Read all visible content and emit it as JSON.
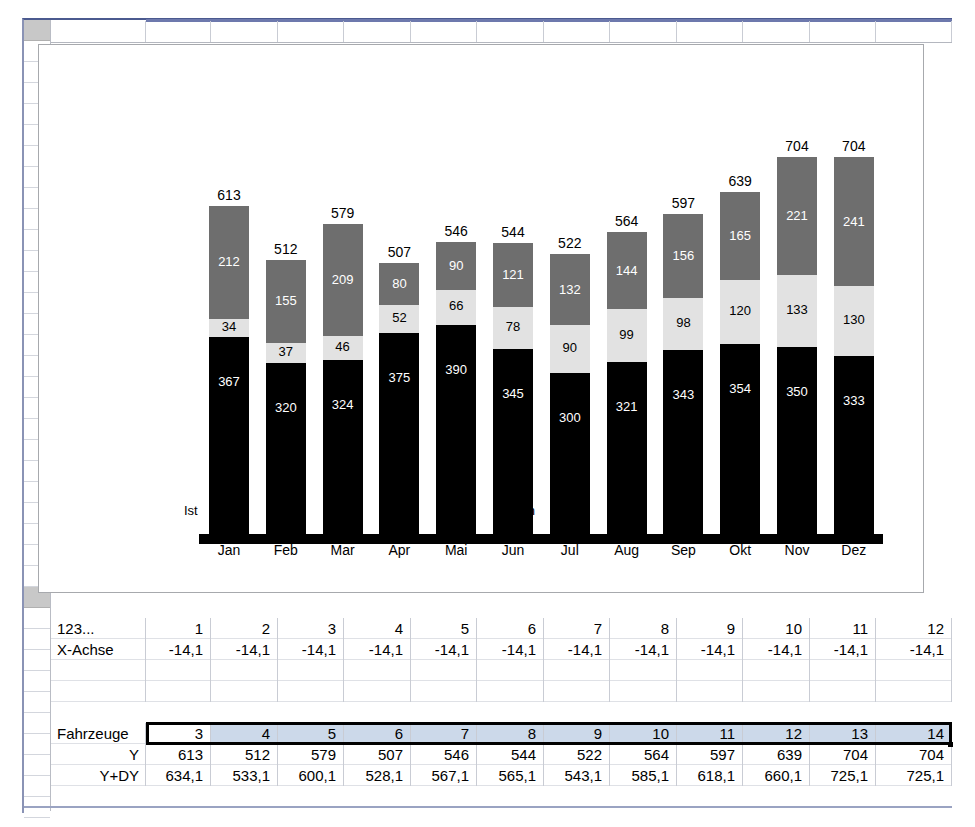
{
  "app": {
    "type": "spreadsheet-with-embedded-chart",
    "colors": {
      "bar_bottom": "#000000",
      "bar_middle": "#e2e2e2",
      "bar_top": "#6e6e6e",
      "selection_fill": "#ccd9ea",
      "selection_border": "#000000",
      "grid_line": "#c9ccd4",
      "frame_border": "#a7a9ad",
      "column_band": "#6d79ad"
    }
  },
  "chart_data": {
    "type": "bar",
    "stacked": true,
    "title": "",
    "xlabel": "",
    "ylabel": "",
    "grid": false,
    "legend_position": "none",
    "categories": [
      "Jan",
      "Feb",
      "Mar",
      "Apr",
      "Mai",
      "Jun",
      "Jul",
      "Aug",
      "Sep",
      "Okt",
      "Nov",
      "Dez"
    ],
    "group_labels": [
      {
        "label": "Ist",
        "x_fraction": 0.04
      },
      {
        "label": "Plan",
        "x_fraction": 0.5
      }
    ],
    "series": [
      {
        "name": "bottom",
        "color": "#000000",
        "values": [
          367,
          320,
          324,
          375,
          390,
          345,
          300,
          321,
          343,
          354,
          350,
          333
        ]
      },
      {
        "name": "middle",
        "color": "#e2e2e2",
        "values": [
          34,
          37,
          46,
          52,
          66,
          78,
          90,
          99,
          98,
          120,
          133,
          130
        ]
      },
      {
        "name": "top",
        "color": "#6e6e6e",
        "values": [
          212,
          155,
          209,
          80,
          90,
          121,
          132,
          144,
          156,
          165,
          221,
          241
        ]
      }
    ],
    "totals": [
      613,
      512,
      579,
      507,
      546,
      544,
      522,
      564,
      597,
      639,
      704,
      704
    ],
    "ylim": [
      0,
      760
    ]
  },
  "data_table": {
    "rows": [
      {
        "label": "123...",
        "label_align": "left",
        "values": [
          "1",
          "2",
          "3",
          "4",
          "5",
          "6",
          "7",
          "8",
          "9",
          "10",
          "11",
          "12"
        ],
        "selected": false
      },
      {
        "label": "X-Achse",
        "label_align": "left",
        "values": [
          "-14,1",
          "-14,1",
          "-14,1",
          "-14,1",
          "-14,1",
          "-14,1",
          "-14,1",
          "-14,1",
          "-14,1",
          "-14,1",
          "-14,1",
          "-14,1"
        ],
        "selected": false
      },
      {
        "label": "",
        "label_align": "left",
        "values": [
          "",
          "",
          "",
          "",
          "",
          "",
          "",
          "",
          "",
          "",
          "",
          ""
        ],
        "selected": false
      },
      {
        "label": "",
        "label_align": "left",
        "values": [
          "",
          "",
          "",
          "",
          "",
          "",
          "",
          "",
          "",
          "",
          "",
          ""
        ],
        "selected": false
      },
      {
        "label": "Fahrzeuge",
        "label_align": "left",
        "values": [
          "3",
          "4",
          "5",
          "6",
          "7",
          "8",
          "9",
          "10",
          "11",
          "12",
          "13",
          "14"
        ],
        "selected": true
      },
      {
        "label": "Y",
        "label_align": "right",
        "values": [
          "613",
          "512",
          "579",
          "507",
          "546",
          "544",
          "522",
          "564",
          "597",
          "639",
          "704",
          "704"
        ],
        "selected": false
      },
      {
        "label": "Y+DY",
        "label_align": "right",
        "values": [
          "634,1",
          "533,1",
          "600,1",
          "528,1",
          "567,1",
          "565,1",
          "543,1",
          "585,1",
          "618,1",
          "660,1",
          "725,1",
          "725,1"
        ],
        "selected": false
      }
    ]
  }
}
